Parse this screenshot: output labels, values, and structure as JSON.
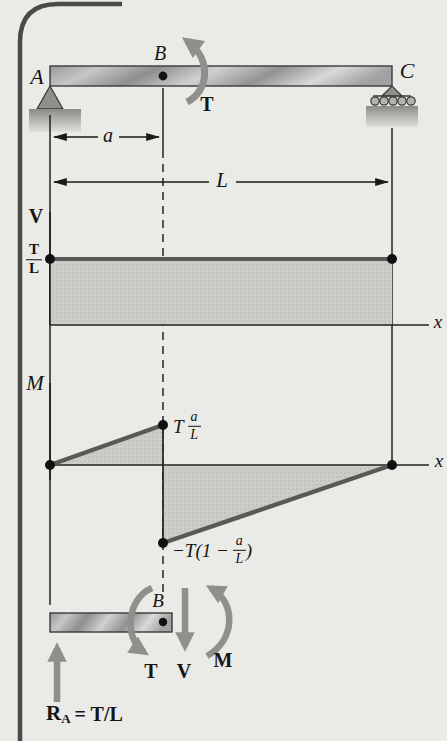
{
  "beam": {
    "label_a": "A",
    "label_b": "B",
    "label_c": "C",
    "torque": "T",
    "dim_a": "a",
    "dim_span": "L"
  },
  "shear": {
    "axis": "V",
    "x_axis": "x",
    "value_num": "T",
    "value_den": "L"
  },
  "moment": {
    "axis": "M",
    "x_axis": "x",
    "peak_coef": "T",
    "peak_num": "a",
    "peak_den": "L",
    "min_prefix": "−T(1 −",
    "min_num": "a",
    "min_den": "L",
    "min_close": ")"
  },
  "fbd": {
    "label_b": "B",
    "torque": "T",
    "shear": "V",
    "moment": "M",
    "reaction_sym": "R",
    "reaction_sub": "A",
    "reaction_value": "= T/L"
  },
  "colors": {
    "background": "#eaeae6",
    "border": "#4a4a48",
    "line": "#222220",
    "thick_line": "#595955",
    "fill_shade": "#ccccc8",
    "arrow_gray": "#908f8b"
  }
}
